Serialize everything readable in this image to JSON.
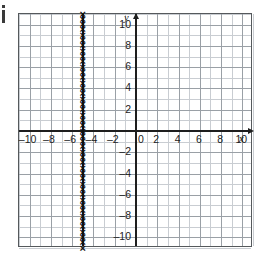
{
  "figure": {
    "corner_mark": "j",
    "background_color": "#ffffff",
    "axis_color": "#1e1e1e",
    "grid_major_color": "#9aa0a6",
    "grid_minor_color": "#c9cdd2",
    "plot_border_color": "#55595c",
    "mark_color": "#111111",
    "mark_glyph": "×"
  },
  "chart_data": {
    "type": "line",
    "title": "",
    "xlabel": "x",
    "ylabel": "y",
    "xlim": [
      -11,
      11
    ],
    "ylim": [
      -11,
      11
    ],
    "grid": true,
    "grid_major_step": 2,
    "grid_minor_step": 1,
    "legend": null,
    "xticks": [
      -10,
      -8,
      -6,
      -4,
      -2,
      0,
      2,
      4,
      6,
      8,
      10
    ],
    "xtick_labels": [
      "–10",
      "–8",
      "–6",
      "–4",
      "–2",
      "0",
      "2",
      "4",
      "6",
      "8",
      "10"
    ],
    "yticks": [
      -10,
      -8,
      -6,
      -4,
      -2,
      2,
      4,
      6,
      8,
      10
    ],
    "ytick_labels": [
      "–10",
      "–8",
      "–6",
      "–4",
      "–2",
      "2",
      "4",
      "6",
      "8",
      "10"
    ],
    "series": [
      {
        "name": "x = -5",
        "equation": "x = -5",
        "type": "vertical-line",
        "x": -5,
        "marker": "x",
        "y_range": [
          -11,
          11
        ],
        "marker_count": 45
      }
    ],
    "annotations": []
  }
}
